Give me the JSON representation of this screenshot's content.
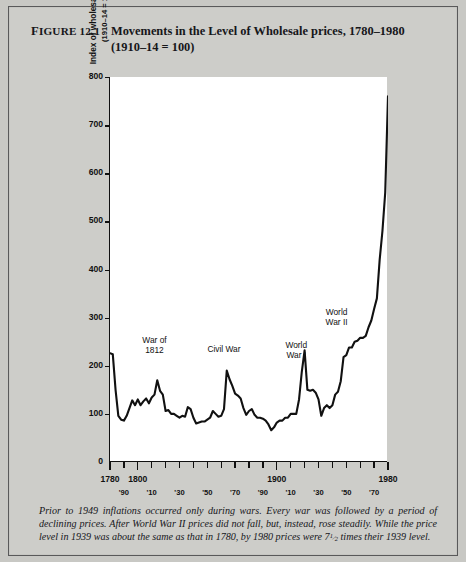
{
  "figure": {
    "number_lead": "F",
    "number": "IGURE 12.1",
    "title_main": "Movements in the Level of Wholesale prices, 1780–1980",
    "title_sub": "(1910–14  =  100)"
  },
  "caption": {
    "text_before_fraction": "Prior to 1949 inflations occurred only during wars.  Every war was followed by a period of declining prices.  After World War II prices did not fall, but, instead, rose steadily.  While the price level in 1939 was about the same as that in 1780, by 1980 prices were 7",
    "fraction_numerator": "1",
    "fraction_denominator": "2",
    "text_after_fraction": " times their 1939 level."
  },
  "colors": {
    "plate_background": "#cdcdc9",
    "plot_background": "#ffffff",
    "ink": "#111111",
    "border": "#59595a"
  },
  "chart_data": {
    "type": "line",
    "title": "Movements in the Level of Wholesale prices, 1780–1980",
    "subtitle": "(1910–14 = 100)",
    "xlabel": "",
    "ylabel": "Index of wholesale prices (1910–14 = 100)",
    "ylabel_line1": "Index of wholesale prices",
    "ylabel_line2": "(1910–14 = 100)",
    "xlim": [
      1780,
      1980
    ],
    "ylim": [
      0,
      800
    ],
    "grid": false,
    "legend": false,
    "y_ticks": [
      0,
      100,
      200,
      300,
      400,
      500,
      600,
      700,
      800
    ],
    "y_tick_labels": [
      "0",
      "100",
      "200",
      "300",
      "400",
      "500",
      "600",
      "700",
      "800"
    ],
    "x_ticks": [
      1780,
      1790,
      1800,
      1810,
      1820,
      1830,
      1840,
      1850,
      1860,
      1870,
      1880,
      1890,
      1900,
      1910,
      1920,
      1930,
      1940,
      1950,
      1960,
      1970,
      1980
    ],
    "x_major_labels": [
      {
        "year": 1780,
        "label": "1780"
      },
      {
        "year": 1800,
        "label": "1800"
      },
      {
        "year": 1900,
        "label": "1900"
      },
      {
        "year": 1980,
        "label": "1980"
      }
    ],
    "x_minor_labels": [
      {
        "year": 1790,
        "label": "'90"
      },
      {
        "year": 1810,
        "label": "'10"
      },
      {
        "year": 1830,
        "label": "'30"
      },
      {
        "year": 1850,
        "label": "'50"
      },
      {
        "year": 1870,
        "label": "'70"
      },
      {
        "year": 1890,
        "label": "'90"
      },
      {
        "year": 1910,
        "label": "'10"
      },
      {
        "year": 1930,
        "label": "'30"
      },
      {
        "year": 1950,
        "label": "'50"
      },
      {
        "year": 1970,
        "label": "'70"
      }
    ],
    "annotations": [
      {
        "label_line1": "War of",
        "label_line2": "1812",
        "year": 1812,
        "value": 262
      },
      {
        "label_line1": "Civil War",
        "label_line2": "",
        "year": 1862,
        "value": 244
      },
      {
        "label_line1": "World",
        "label_line2": "War I",
        "year": 1914,
        "value": 252
      },
      {
        "label_line1": "World",
        "label_line2": "War II",
        "year": 1943,
        "value": 320
      }
    ],
    "series": [
      {
        "name": "Index of wholesale prices",
        "x": [
          1780,
          1782,
          1784,
          1786,
          1788,
          1790,
          1792,
          1794,
          1796,
          1798,
          1800,
          1802,
          1804,
          1806,
          1808,
          1810,
          1812,
          1814,
          1816,
          1818,
          1820,
          1822,
          1824,
          1826,
          1828,
          1830,
          1832,
          1834,
          1836,
          1838,
          1840,
          1842,
          1844,
          1846,
          1848,
          1850,
          1852,
          1854,
          1856,
          1858,
          1860,
          1862,
          1864,
          1866,
          1868,
          1870,
          1872,
          1874,
          1876,
          1878,
          1880,
          1882,
          1884,
          1886,
          1888,
          1890,
          1892,
          1894,
          1896,
          1898,
          1900,
          1902,
          1904,
          1906,
          1908,
          1910,
          1912,
          1914,
          1916,
          1918,
          1920,
          1922,
          1924,
          1926,
          1928,
          1930,
          1932,
          1934,
          1936,
          1938,
          1940,
          1942,
          1944,
          1946,
          1948,
          1950,
          1952,
          1954,
          1956,
          1958,
          1960,
          1962,
          1964,
          1966,
          1968,
          1970,
          1972,
          1974,
          1976,
          1978,
          1980
        ],
        "y": [
          226,
          224,
          150,
          96,
          88,
          86,
          96,
          112,
          128,
          118,
          130,
          118,
          126,
          132,
          122,
          134,
          140,
          170,
          148,
          140,
          106,
          108,
          100,
          100,
          96,
          92,
          96,
          94,
          114,
          110,
          92,
          80,
          82,
          84,
          84,
          88,
          92,
          106,
          100,
          94,
          96,
          110,
          190,
          172,
          158,
          142,
          138,
          132,
          112,
          98,
          106,
          110,
          98,
          92,
          92,
          90,
          86,
          78,
          66,
          72,
          82,
          86,
          86,
          92,
          92,
          100,
          100,
          100,
          130,
          188,
          232,
          150,
          148,
          150,
          144,
          130,
          96,
          112,
          118,
          112,
          118,
          140,
          146,
          168,
          218,
          222,
          238,
          238,
          250,
          252,
          258,
          258,
          262,
          280,
          294,
          318,
          340,
          420,
          480,
          560,
          760
        ]
      }
    ]
  }
}
